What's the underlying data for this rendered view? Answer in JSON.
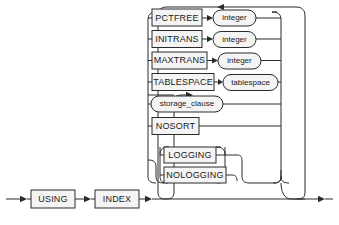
{
  "diagram": {
    "type": "railroad-syntax-diagram",
    "colors": {
      "stroke": "#2b2b2b",
      "fill": "#f4f4f4",
      "text": "#1a1a1a",
      "background": "#ffffff"
    },
    "entry_label": "",
    "prefix": [
      {
        "id": "using",
        "label": "USING",
        "shape": "rect"
      },
      {
        "id": "index",
        "label": "INDEX",
        "shape": "rect"
      }
    ],
    "options": [
      {
        "id": "pctfree",
        "keyword": {
          "label": "PCTFREE",
          "shape": "rect"
        },
        "argument": {
          "label": "integer",
          "shape": "oval"
        }
      },
      {
        "id": "initrans",
        "keyword": {
          "label": "INITRANS",
          "shape": "rect"
        },
        "argument": {
          "label": "integer",
          "shape": "oval"
        }
      },
      {
        "id": "maxtrans",
        "keyword": {
          "label": "MAXTRANS",
          "shape": "rect"
        },
        "argument": {
          "label": "integer",
          "shape": "oval"
        }
      },
      {
        "id": "tablespace",
        "keyword": {
          "label": "TABLESPACE",
          "shape": "rect"
        },
        "argument": {
          "label": "tablespace",
          "shape": "oval"
        }
      },
      {
        "id": "storage_clause",
        "keyword": {
          "label": "storage_clause",
          "shape": "oval"
        },
        "argument": null
      },
      {
        "id": "nosort",
        "keyword": {
          "label": "NOSORT",
          "shape": "rect"
        },
        "argument": null
      }
    ],
    "nested_group": {
      "id": "logging-group",
      "choices": [
        {
          "id": "logging",
          "label": "LOGGING",
          "shape": "rect"
        },
        {
          "id": "nologging",
          "label": "NOLOGGING",
          "shape": "rect"
        }
      ]
    },
    "loop": {
      "direction": "left",
      "repeatable": true
    }
  }
}
